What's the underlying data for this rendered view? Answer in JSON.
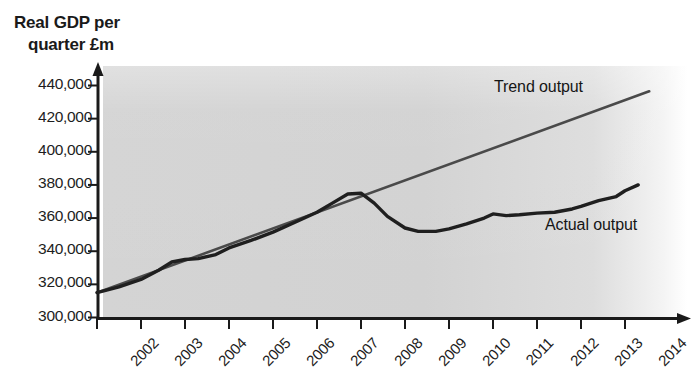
{
  "chart_data": {
    "type": "line",
    "title": "Real GDP per quarter £m",
    "title_line1": "Real GDP per",
    "title_line2": "quarter £m",
    "ylabel": "Real GDP per quarter £m",
    "xlabel": "",
    "ylim": [
      300000,
      440000
    ],
    "ytick_step": 20000,
    "ytick_labels": [
      "440,000",
      "420,000",
      "400,000",
      "380,000",
      "360,000",
      "340,000",
      "320,000",
      "300,000"
    ],
    "ytick_values": [
      440000,
      420000,
      400000,
      380000,
      360000,
      340000,
      320000,
      300000
    ],
    "categories": [
      "2002",
      "2003",
      "2004",
      "2005",
      "2006",
      "2007",
      "2008",
      "2009",
      "2010",
      "2011",
      "2012",
      "2013",
      "2014"
    ],
    "x": [
      2002,
      2003,
      2004,
      2005,
      2006,
      2007,
      2008,
      2009,
      2010,
      2011,
      2012,
      2013,
      2014
    ],
    "xlim": [
      2002,
      2014
    ],
    "grid": false,
    "legend_position": "inline-annotations",
    "series": [
      {
        "name": "Trend output",
        "color": "#4a4a4a",
        "x": [
          2002,
          2014.55
        ],
        "values": [
          315000,
          436500
        ]
      },
      {
        "name": "Actual output",
        "color": "#1f1f1f",
        "x": [
          2002,
          2002.5,
          2003,
          2003.4,
          2003.7,
          2004,
          2004.3,
          2004.7,
          2005,
          2005.5,
          2006,
          2006.5,
          2007,
          2007.35,
          2007.7,
          2008,
          2008.3,
          2008.6,
          2009,
          2009.3,
          2009.7,
          2010,
          2010.4,
          2010.8,
          2011,
          2011.3,
          2011.6,
          2012,
          2012.4,
          2012.8,
          2013,
          2013.4,
          2013.8,
          2014,
          2014.3
        ],
        "values": [
          315000,
          318500,
          323000,
          328500,
          333500,
          335000,
          335500,
          338000,
          342000,
          346500,
          351500,
          357500,
          363500,
          369000,
          374500,
          375000,
          369000,
          361000,
          354000,
          352000,
          352000,
          353500,
          356500,
          360000,
          362500,
          361500,
          362000,
          363000,
          363500,
          365500,
          367000,
          370500,
          373000,
          376500,
          380000
        ]
      }
    ],
    "annotations": [
      {
        "text": "Trend output",
        "x": 2013.0,
        "y": 428000
      },
      {
        "text": "Actual output",
        "x": 2012.3,
        "y": 358000
      }
    ]
  },
  "axis": {
    "y_arrow": "up-arrow",
    "x_arrow": "right-arrow"
  }
}
